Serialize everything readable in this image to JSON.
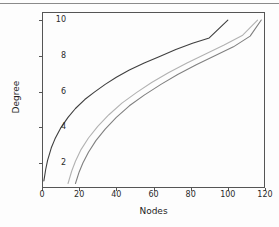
{
  "figure": {
    "background_color": "#fdfdfd",
    "frame_color": "#555555"
  },
  "axis": {
    "x_label": "Nodes",
    "y_label": "Degree",
    "x_ticks": [
      "0",
      "20",
      "40",
      "60",
      "80",
      "100",
      "120"
    ],
    "y_ticks": [
      "2",
      "4",
      "6",
      "8",
      "10"
    ]
  },
  "chart_data": {
    "type": "line",
    "title": "",
    "xlabel": "Nodes",
    "ylabel": "Degree",
    "xlim": [
      0,
      120
    ],
    "ylim": [
      0.6,
      10.45
    ],
    "xticks": [
      0,
      20,
      40,
      60,
      80,
      100,
      120
    ],
    "yticks": [
      2,
      4,
      6,
      8,
      10
    ],
    "grid": false,
    "legend": false,
    "series": [
      {
        "name": "curve-dark",
        "color": "#3f3f3f",
        "x": [
          1,
          2,
          3,
          5,
          7,
          10,
          14,
          18,
          23,
          28,
          34,
          40,
          47,
          55,
          63,
          72,
          81,
          90,
          100
        ],
        "y": [
          1.0,
          1.65,
          2.15,
          2.85,
          3.35,
          3.95,
          4.55,
          5.05,
          5.55,
          5.95,
          6.4,
          6.8,
          7.2,
          7.6,
          7.95,
          8.35,
          8.7,
          9.0,
          10.0
        ]
      },
      {
        "name": "curve-light",
        "color": "#b2b2b2",
        "x": [
          14,
          16,
          18,
          21,
          25,
          30,
          36,
          43,
          51,
          59,
          68,
          78,
          88,
          98,
          108,
          116
        ],
        "y": [
          0.85,
          1.55,
          2.1,
          2.75,
          3.4,
          4.05,
          4.7,
          5.35,
          5.95,
          6.5,
          7.05,
          7.6,
          8.1,
          8.6,
          9.15,
          10.0
        ]
      },
      {
        "name": "curve-mid",
        "color": "#808080",
        "x": [
          18,
          20,
          22,
          25,
          29,
          34,
          40,
          47,
          55,
          64,
          73,
          83,
          93,
          103,
          112,
          118
        ],
        "y": [
          0.85,
          1.5,
          2.0,
          2.6,
          3.25,
          3.9,
          4.55,
          5.2,
          5.8,
          6.4,
          6.95,
          7.5,
          8.0,
          8.5,
          9.1,
          10.0
        ]
      }
    ]
  }
}
